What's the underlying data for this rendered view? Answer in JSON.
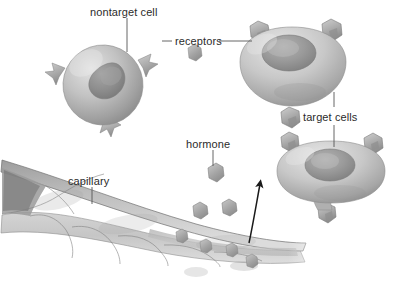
{
  "figure": {
    "background_color": "#ffffff",
    "label_color": "#2b2b2b",
    "leader_line_color": "#555555",
    "arrow_color": "#1a1a1a",
    "cell_fill_light": "#d8d8d8",
    "cell_fill_mid": "#b4b4b4",
    "cell_fill_dark": "#8d8d8d",
    "nucleus_color": "#8a8a8a",
    "receptor_color": "#a8a8a8",
    "hormone_color": "#9a9a9a",
    "capillary_color": "#c9c9c9"
  },
  "labels": {
    "nontarget_cell": "nontarget cell",
    "receptors": "receptors",
    "target_cells": "target cells",
    "hormone": "hormone",
    "capillary": "capillary"
  },
  "structures": {
    "nontarget_cell": {
      "name": "nontarget cell",
      "receptor_count": 3,
      "binds_hormone": false
    },
    "target_cell_upper": {
      "name": "target cell",
      "receptor_count": 3,
      "binds_hormone": true
    },
    "target_cell_lower": {
      "name": "target cell",
      "receptor_count": 3,
      "binds_hormone": true
    },
    "free_receptor_count": 1,
    "free_hormone_count": 3,
    "capillary_hormone_count": 4,
    "arrow_count": 1
  }
}
